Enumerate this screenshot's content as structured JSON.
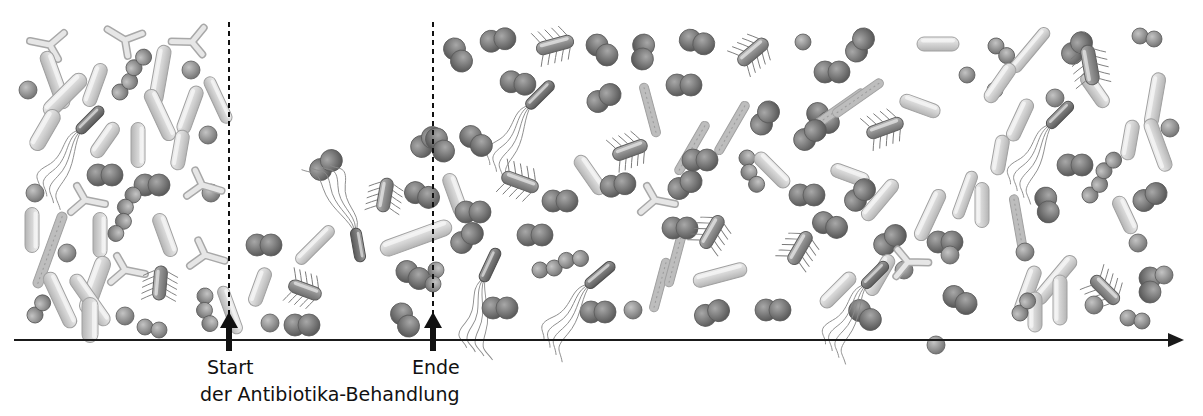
{
  "timeline": {
    "axis_color": "#1a1a1a",
    "markers": [
      {
        "id": "start",
        "label": "Start",
        "x": 229
      },
      {
        "id": "end",
        "label": "Ende",
        "x": 433
      }
    ],
    "caption": "der Antibiotika-Behandlung"
  },
  "colors": {
    "coccus_dark": "#6e6e6e",
    "coccus_mid": "#8a8a8a",
    "rod_light": "#d4d4d4",
    "rod_dark": "#7a7a7a",
    "outline": "#9a9a9a"
  },
  "bacteria": [
    {
      "t": "y",
      "x": 50,
      "y": 45,
      "r": 0
    },
    {
      "t": "y",
      "x": 125,
      "y": 40,
      "r": 20
    },
    {
      "t": "y",
      "x": 192,
      "y": 42,
      "r": -10
    },
    {
      "t": "rod",
      "x": 55,
      "y": 80,
      "l": 60,
      "w": 14,
      "r": 70
    },
    {
      "t": "rod",
      "x": 65,
      "y": 95,
      "l": 55,
      "w": 16,
      "r": -45
    },
    {
      "t": "rod",
      "x": 95,
      "y": 85,
      "l": 45,
      "w": 14,
      "r": -70
    },
    {
      "t": "rod",
      "x": 160,
      "y": 75,
      "l": 60,
      "w": 14,
      "r": -80
    },
    {
      "t": "rod",
      "x": 160,
      "y": 115,
      "l": 55,
      "w": 14,
      "r": 65
    },
    {
      "t": "rod",
      "x": 190,
      "y": 110,
      "l": 50,
      "w": 14,
      "r": -70
    },
    {
      "t": "rod",
      "x": 218,
      "y": 100,
      "l": 50,
      "w": 12,
      "r": 65
    },
    {
      "t": "rod",
      "x": 45,
      "y": 130,
      "l": 45,
      "w": 16,
      "r": -60
    },
    {
      "t": "rod",
      "x": 105,
      "y": 140,
      "l": 40,
      "w": 14,
      "r": -55
    },
    {
      "t": "rod",
      "x": 138,
      "y": 145,
      "l": 45,
      "w": 14,
      "r": 90
    },
    {
      "t": "rod",
      "x": 180,
      "y": 150,
      "l": 40,
      "w": 14,
      "r": -80
    },
    {
      "t": "sphere",
      "x": 28,
      "y": 90,
      "s": 9
    },
    {
      "t": "sphere",
      "x": 191,
      "y": 70,
      "s": 9
    },
    {
      "t": "sphere",
      "x": 208,
      "y": 135,
      "s": 9
    },
    {
      "t": "chain",
      "x": 120,
      "y": 92,
      "r": -60,
      "n": 4
    },
    {
      "t": "flag",
      "x": 90,
      "y": 120,
      "l": 35,
      "r": -45,
      "dark": true
    },
    {
      "t": "diplo",
      "x": 105,
      "y": 175,
      "r": 0
    },
    {
      "t": "diplo",
      "x": 152,
      "y": 185,
      "r": 0
    },
    {
      "t": "sphere",
      "x": 35,
      "y": 193,
      "s": 9
    },
    {
      "t": "sphere",
      "x": 211,
      "y": 193,
      "s": 9
    },
    {
      "t": "chain",
      "x": 133,
      "y": 195,
      "r": 110,
      "n": 4
    },
    {
      "t": "y",
      "x": 85,
      "y": 200,
      "r": 180
    },
    {
      "t": "y",
      "x": 202,
      "y": 185,
      "r": 185
    },
    {
      "t": "rod",
      "x": 32,
      "y": 230,
      "l": 45,
      "w": 14,
      "r": 90
    },
    {
      "t": "rod",
      "x": 50,
      "y": 250,
      "l": 80,
      "w": 10,
      "r": -70,
      "dashed": true
    },
    {
      "t": "rod",
      "x": 100,
      "y": 235,
      "l": 45,
      "w": 14,
      "r": 90
    },
    {
      "t": "rod",
      "x": 165,
      "y": 235,
      "l": 45,
      "w": 14,
      "r": 70
    },
    {
      "t": "rod",
      "x": 95,
      "y": 285,
      "l": 60,
      "w": 16,
      "r": -70
    },
    {
      "t": "rod",
      "x": 90,
      "y": 300,
      "l": 60,
      "w": 14,
      "r": 55
    },
    {
      "t": "rod",
      "x": 60,
      "y": 300,
      "l": 60,
      "w": 14,
      "r": 65
    },
    {
      "t": "rod",
      "x": 90,
      "y": 320,
      "l": 45,
      "w": 16,
      "r": 90
    },
    {
      "t": "sphere",
      "x": 67,
      "y": 253,
      "s": 9
    },
    {
      "t": "sphere",
      "x": 125,
      "y": 316,
      "s": 9
    },
    {
      "t": "y",
      "x": 125,
      "y": 270,
      "r": 180
    },
    {
      "t": "y",
      "x": 205,
      "y": 255,
      "r": 185
    },
    {
      "t": "ecoli",
      "x": 160,
      "y": 283,
      "l": 34,
      "r": -85
    },
    {
      "t": "chain",
      "x": 35,
      "y": 315,
      "r": -70,
      "n": 2
    },
    {
      "t": "chain",
      "x": 205,
      "y": 296,
      "r": 80,
      "n": 3
    },
    {
      "t": "chain",
      "x": 145,
      "y": 327,
      "r": 0,
      "n": 2
    },
    {
      "t": "rod",
      "x": 230,
      "y": 310,
      "l": 50,
      "w": 12,
      "r": 70
    },
    {
      "t": "diplo",
      "x": 326,
      "y": 165,
      "r": -40
    },
    {
      "t": "diplo",
      "x": 427,
      "y": 142,
      "r": -40
    },
    {
      "t": "diplo",
      "x": 264,
      "y": 245,
      "r": 0
    },
    {
      "t": "rod",
      "x": 315,
      "y": 245,
      "l": 50,
      "w": 12,
      "r": -45
    },
    {
      "t": "ecoli",
      "x": 385,
      "y": 195,
      "l": 34,
      "r": -80
    },
    {
      "t": "diplo",
      "x": 422,
      "y": 195,
      "r": 20
    },
    {
      "t": "rod",
      "x": 416,
      "y": 238,
      "l": 75,
      "w": 16,
      "r": -20
    },
    {
      "t": "rod",
      "x": 260,
      "y": 287,
      "l": 40,
      "w": 14,
      "r": -70
    },
    {
      "t": "ecoli",
      "x": 305,
      "y": 290,
      "l": 34,
      "r": 20
    },
    {
      "t": "flag",
      "x": 358,
      "y": 245,
      "l": 34,
      "r": 80,
      "dark": true,
      "down": true
    },
    {
      "t": "diplo",
      "x": 413,
      "y": 275,
      "r": 30
    },
    {
      "t": "sphere",
      "x": 270,
      "y": 323,
      "s": 9
    },
    {
      "t": "diplo",
      "x": 302,
      "y": 325,
      "r": 0
    },
    {
      "t": "diplo",
      "x": 405,
      "y": 320,
      "r": 60
    },
    {
      "t": "chain",
      "x": 436,
      "y": 270,
      "r": 90,
      "n": 2
    },
    {
      "t": "diplo",
      "x": 458,
      "y": 55,
      "r": 60
    },
    {
      "t": "diplo",
      "x": 498,
      "y": 40,
      "r": -10
    },
    {
      "t": "ecoli",
      "x": 555,
      "y": 45,
      "l": 38,
      "r": -15
    },
    {
      "t": "diplo",
      "x": 602,
      "y": 50,
      "r": 45
    },
    {
      "t": "diplo",
      "x": 643,
      "y": 52,
      "r": 95
    },
    {
      "t": "diplo",
      "x": 697,
      "y": 42,
      "r": 15
    },
    {
      "t": "ecoli",
      "x": 753,
      "y": 52,
      "l": 36,
      "r": -40
    },
    {
      "t": "sphere",
      "x": 803,
      "y": 42,
      "s": 8
    },
    {
      "t": "diplo",
      "x": 860,
      "y": 45,
      "r": -60
    },
    {
      "t": "diplo",
      "x": 832,
      "y": 72,
      "r": 0
    },
    {
      "t": "rod",
      "x": 938,
      "y": 44,
      "l": 42,
      "w": 14,
      "r": 0
    },
    {
      "t": "chain",
      "x": 996,
      "y": 46,
      "r": 30,
      "n": 2
    },
    {
      "t": "rod",
      "x": 1030,
      "y": 50,
      "l": 55,
      "w": 12,
      "r": -50
    },
    {
      "t": "diplo",
      "x": 1077,
      "y": 48,
      "r": -50
    },
    {
      "t": "chain",
      "x": 1140,
      "y": 36,
      "r": 0,
      "n": 2
    },
    {
      "t": "diplo",
      "x": 518,
      "y": 83,
      "r": 10
    },
    {
      "t": "flag",
      "x": 540,
      "y": 95,
      "l": 36,
      "r": -45,
      "dark": true
    },
    {
      "t": "diplo",
      "x": 604,
      "y": 98,
      "r": -30
    },
    {
      "t": "rod",
      "x": 650,
      "y": 110,
      "l": 55,
      "w": 9,
      "r": 75,
      "dashed": true
    },
    {
      "t": "diplo",
      "x": 684,
      "y": 85,
      "r": 0
    },
    {
      "t": "rod",
      "x": 692,
      "y": 148,
      "l": 60,
      "w": 9,
      "r": -60,
      "dashed": true
    },
    {
      "t": "rod",
      "x": 732,
      "y": 128,
      "l": 60,
      "w": 9,
      "r": -60,
      "dashed": true
    },
    {
      "t": "diplo",
      "x": 765,
      "y": 118,
      "r": -60
    },
    {
      "t": "diplo",
      "x": 823,
      "y": 118,
      "r": 40
    },
    {
      "t": "rod",
      "x": 840,
      "y": 108,
      "l": 60,
      "w": 9,
      "r": -35,
      "dashed": true
    },
    {
      "t": "rod",
      "x": 858,
      "y": 98,
      "l": 60,
      "w": 9,
      "r": -35,
      "dashed": true
    },
    {
      "t": "rod",
      "x": 920,
      "y": 106,
      "l": 42,
      "w": 14,
      "r": 20
    },
    {
      "t": "ecoli",
      "x": 885,
      "y": 128,
      "l": 38,
      "r": -20
    },
    {
      "t": "sphere",
      "x": 967,
      "y": 75,
      "s": 8
    },
    {
      "t": "sphere",
      "x": 995,
      "y": 90,
      "s": 8
    },
    {
      "t": "rod",
      "x": 1000,
      "y": 83,
      "l": 45,
      "w": 14,
      "r": -55
    },
    {
      "t": "rod",
      "x": 1020,
      "y": 120,
      "l": 45,
      "w": 14,
      "r": -65
    },
    {
      "t": "rod",
      "x": 1000,
      "y": 155,
      "l": 40,
      "w": 14,
      "r": -80
    },
    {
      "t": "sphere",
      "x": 1055,
      "y": 98,
      "s": 9
    },
    {
      "t": "rod",
      "x": 1095,
      "y": 90,
      "l": 40,
      "w": 14,
      "r": 55
    },
    {
      "t": "ecoli",
      "x": 1090,
      "y": 65,
      "l": 40,
      "w": 14,
      "r": -100
    },
    {
      "t": "flag",
      "x": 1060,
      "y": 115,
      "l": 34,
      "r": -45,
      "dark": true
    },
    {
      "t": "rod",
      "x": 1130,
      "y": 140,
      "l": 40,
      "w": 14,
      "r": -80
    },
    {
      "t": "rod",
      "x": 1155,
      "y": 100,
      "l": 55,
      "w": 14,
      "r": -80
    },
    {
      "t": "rod",
      "x": 1158,
      "y": 145,
      "l": 55,
      "w": 14,
      "r": -110
    },
    {
      "t": "sphere",
      "x": 1170,
      "y": 128,
      "s": 9
    },
    {
      "t": "diplo",
      "x": 1075,
      "y": 165,
      "r": 0
    },
    {
      "t": "diplo",
      "x": 440,
      "y": 145,
      "r": 60
    },
    {
      "t": "rod",
      "x": 455,
      "y": 195,
      "l": 45,
      "w": 14,
      "r": 70
    },
    {
      "t": "diplo",
      "x": 476,
      "y": 141,
      "r": 40
    },
    {
      "t": "diplo",
      "x": 473,
      "y": 212,
      "r": 0
    },
    {
      "t": "diplo",
      "x": 467,
      "y": 238,
      "r": -40
    },
    {
      "t": "ecoli",
      "x": 520,
      "y": 182,
      "l": 38,
      "r": 20
    },
    {
      "t": "rod",
      "x": 590,
      "y": 175,
      "l": 45,
      "w": 14,
      "r": 55
    },
    {
      "t": "diplo",
      "x": 560,
      "y": 201,
      "r": 0
    },
    {
      "t": "diplo",
      "x": 535,
      "y": 235,
      "r": 0
    },
    {
      "t": "chain",
      "x": 540,
      "y": 270,
      "r": -20,
      "n": 4
    },
    {
      "t": "flag",
      "x": 490,
      "y": 265,
      "l": 36,
      "r": -65,
      "dark": true
    },
    {
      "t": "diplo",
      "x": 500,
      "y": 308,
      "r": 0
    },
    {
      "t": "diplo",
      "x": 618,
      "y": 185,
      "r": -10
    },
    {
      "t": "ecoli",
      "x": 630,
      "y": 150,
      "l": 36,
      "r": -20
    },
    {
      "t": "diplo",
      "x": 598,
      "y": 312,
      "r": 0
    },
    {
      "t": "flag",
      "x": 600,
      "y": 275,
      "l": 36,
      "r": -40,
      "dark": true
    },
    {
      "t": "sphere",
      "x": 633,
      "y": 310,
      "s": 9
    },
    {
      "t": "y",
      "x": 655,
      "y": 200,
      "r": 180
    },
    {
      "t": "rod",
      "x": 660,
      "y": 285,
      "l": 55,
      "w": 9,
      "r": -75,
      "dashed": true
    },
    {
      "t": "rod",
      "x": 675,
      "y": 260,
      "l": 55,
      "w": 9,
      "r": -75,
      "dashed": true
    },
    {
      "t": "diplo",
      "x": 685,
      "y": 185,
      "r": -30
    },
    {
      "t": "diplo",
      "x": 680,
      "y": 228,
      "r": 0
    },
    {
      "t": "diplo",
      "x": 712,
      "y": 313,
      "r": -20
    },
    {
      "t": "ecoli",
      "x": 712,
      "y": 232,
      "l": 36,
      "r": -60
    },
    {
      "t": "rod",
      "x": 720,
      "y": 275,
      "l": 55,
      "w": 14,
      "r": -15
    },
    {
      "t": "diplo",
      "x": 700,
      "y": 160,
      "r": 0
    },
    {
      "t": "chain",
      "x": 747,
      "y": 158,
      "r": 70,
      "n": 3
    },
    {
      "t": "rod",
      "x": 772,
      "y": 170,
      "l": 45,
      "w": 14,
      "r": 45
    },
    {
      "t": "diplo",
      "x": 773,
      "y": 310,
      "r": 0
    },
    {
      "t": "diplo",
      "x": 810,
      "y": 135,
      "r": -40
    },
    {
      "t": "diplo",
      "x": 807,
      "y": 195,
      "r": 0
    },
    {
      "t": "ecoli",
      "x": 800,
      "y": 248,
      "l": 36,
      "r": -60
    },
    {
      "t": "diplo",
      "x": 830,
      "y": 225,
      "r": 20
    },
    {
      "t": "rod",
      "x": 850,
      "y": 175,
      "l": 40,
      "w": 14,
      "r": 20
    },
    {
      "t": "diplo",
      "x": 860,
      "y": 195,
      "r": -50
    },
    {
      "t": "rod",
      "x": 880,
      "y": 200,
      "l": 50,
      "w": 14,
      "r": -50
    },
    {
      "t": "diplo",
      "x": 865,
      "y": 315,
      "r": 40
    },
    {
      "t": "rod",
      "x": 838,
      "y": 290,
      "l": 45,
      "w": 14,
      "r": -45
    },
    {
      "t": "diplo",
      "x": 890,
      "y": 240,
      "r": -40
    },
    {
      "t": "sphere",
      "x": 904,
      "y": 270,
      "s": 9
    },
    {
      "t": "rod",
      "x": 880,
      "y": 275,
      "l": 45,
      "w": 14,
      "r": -60
    },
    {
      "t": "rod",
      "x": 930,
      "y": 215,
      "l": 55,
      "w": 14,
      "r": -65
    },
    {
      "t": "rod",
      "x": 965,
      "y": 195,
      "l": 50,
      "w": 12,
      "r": -70
    },
    {
      "t": "y",
      "x": 908,
      "y": 262,
      "r": 170
    },
    {
      "t": "diplo",
      "x": 945,
      "y": 242,
      "r": 0
    },
    {
      "t": "sphere",
      "x": 950,
      "y": 255,
      "s": 9
    },
    {
      "t": "diplo",
      "x": 960,
      "y": 300,
      "r": 30
    },
    {
      "t": "sphere",
      "x": 936,
      "y": 345,
      "s": 9
    },
    {
      "t": "flag",
      "x": 875,
      "y": 275,
      "l": 34,
      "r": -45,
      "dark": true
    },
    {
      "t": "rod",
      "x": 982,
      "y": 205,
      "l": 45,
      "w": 14,
      "r": -90
    },
    {
      "t": "rod",
      "x": 1018,
      "y": 222,
      "l": 55,
      "w": 9,
      "r": 80,
      "dashed": true
    },
    {
      "t": "diplo",
      "x": 1047,
      "y": 205,
      "r": 80
    },
    {
      "t": "sphere",
      "x": 1025,
      "y": 252,
      "s": 9
    },
    {
      "t": "rod",
      "x": 1028,
      "y": 290,
      "l": 50,
      "w": 14,
      "r": -70
    },
    {
      "t": "rod",
      "x": 1055,
      "y": 280,
      "l": 60,
      "w": 14,
      "r": -50
    },
    {
      "t": "rod",
      "x": 1060,
      "y": 300,
      "l": 50,
      "w": 14,
      "r": -90
    },
    {
      "t": "rod",
      "x": 1035,
      "y": 312,
      "l": 40,
      "w": 14,
      "r": -90
    },
    {
      "t": "chain",
      "x": 1090,
      "y": 195,
      "r": -60,
      "n": 4
    },
    {
      "t": "rod",
      "x": 1125,
      "y": 215,
      "l": 40,
      "w": 14,
      "r": 65
    },
    {
      "t": "diplo",
      "x": 1150,
      "y": 197,
      "r": -30
    },
    {
      "t": "sphere",
      "x": 1138,
      "y": 243,
      "s": 9
    },
    {
      "t": "ecoli",
      "x": 1105,
      "y": 290,
      "l": 36,
      "r": 45
    },
    {
      "t": "diplo",
      "x": 1150,
      "y": 285,
      "r": 90
    },
    {
      "t": "chain",
      "x": 1020,
      "y": 313,
      "r": -70,
      "n": 2
    },
    {
      "t": "sphere",
      "x": 1094,
      "y": 305,
      "s": 9
    },
    {
      "t": "chain",
      "x": 1128,
      "y": 318,
      "r": 0,
      "n": 2
    },
    {
      "t": "sphere",
      "x": 1164,
      "y": 275,
      "s": 9
    }
  ]
}
